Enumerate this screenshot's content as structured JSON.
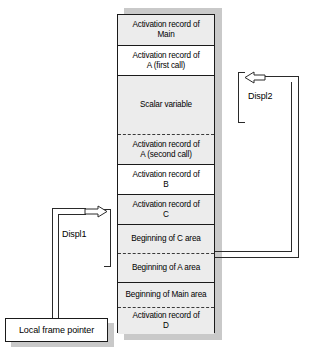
{
  "diagram": {
    "stack": {
      "name": "runtime-stack",
      "rows": [
        {
          "id": "ar-main",
          "line1": "Activation record of",
          "line2": "Main",
          "fill": "hatch",
          "top": 0,
          "height": 30,
          "sep": "none"
        },
        {
          "id": "ar-a-first",
          "line1": "Activation record of",
          "line2": "A (first call)",
          "fill": "plain",
          "top": 30,
          "height": 30,
          "sep": "solid"
        },
        {
          "id": "scalar-var",
          "line1": "Scalar variable",
          "line2": "",
          "fill": "hatch",
          "top": 60,
          "height": 59,
          "sep": "solid"
        },
        {
          "id": "ar-a-second",
          "line1": "Activation record of",
          "line2": "A (second call)",
          "fill": "hatch",
          "top": 119,
          "height": 30,
          "sep": "dash"
        },
        {
          "id": "ar-b",
          "line1": "Activation record of",
          "line2": "B",
          "fill": "plain",
          "top": 149,
          "height": 30,
          "sep": "solid"
        },
        {
          "id": "ar-c",
          "line1": "Activation record of",
          "line2": "C",
          "fill": "hatch",
          "top": 179,
          "height": 30,
          "sep": "solid"
        },
        {
          "id": "begin-c",
          "line1": "Beginning of C area",
          "line2": "",
          "fill": "hatch",
          "top": 209,
          "height": 29,
          "sep": "solid"
        },
        {
          "id": "begin-a",
          "line1": "Beginning of A area",
          "line2": "",
          "fill": "hatch",
          "top": 238,
          "height": 29,
          "sep": "dash"
        },
        {
          "id": "begin-main",
          "line1": "Beginning of Main area",
          "line2": "",
          "fill": "hatch",
          "top": 267,
          "height": 25,
          "sep": "solid"
        },
        {
          "id": "ar-d",
          "line1": "Activation record of",
          "line2": "D",
          "fill": "hatch",
          "top": 292,
          "height": 27,
          "sep": "dash"
        }
      ]
    },
    "labels": {
      "displ1": "Displ1",
      "displ2": "Displ2",
      "local_frame_pointer": "Local frame pointer"
    },
    "colors": {
      "line": "#2a2a2a",
      "border": "#1a1a1a",
      "shadow": "#c9c9c9",
      "hatch_fill": "#ececec",
      "plain_fill": "#ffffff",
      "text": "#000000"
    }
  }
}
